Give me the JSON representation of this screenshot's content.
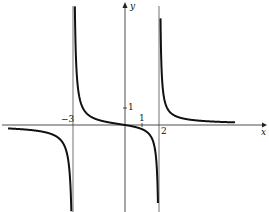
{
  "chart_data": {
    "type": "line",
    "title": "",
    "xlabel": "x",
    "ylabel": "y",
    "function": "y = x / ((x + 3)(x - 2))",
    "vertical_asymptotes": [
      -3,
      2
    ],
    "horizontal_asymptote": 0,
    "x_tick_labels": [
      "-3",
      "1",
      "2"
    ],
    "y_tick_labels": [
      "1"
    ],
    "xlim": [
      -7,
      6
    ],
    "ylim": [
      -5,
      7
    ],
    "grid": false,
    "series": [
      {
        "name": "left branch",
        "x": [
          -7,
          -6,
          -5,
          -4,
          -3.5,
          -3.2,
          -3.1
        ],
        "y": [
          -0.25,
          -0.25,
          -0.357,
          -0.667,
          -1.273,
          -3.098,
          -6.078
        ]
      },
      {
        "name": "middle branch",
        "x": [
          -2.9,
          -2.5,
          -2,
          -1,
          0,
          0.5,
          1,
          1.5,
          1.8,
          1.9
        ],
        "y": [
          7.07,
          1.111,
          0.5,
          0.167,
          0,
          -0.095,
          -0.25,
          -0.667,
          -1.875,
          -3.878
        ]
      },
      {
        "name": "right branch",
        "x": [
          2.1,
          2.3,
          2.5,
          3,
          4,
          5,
          6
        ],
        "y": [
          4.038,
          1.447,
          0.909,
          0.5,
          0.286,
          0.208,
          0.167
        ]
      }
    ]
  },
  "labels": {
    "x_axis": "x",
    "y_axis": "y",
    "tick_neg3": "−3",
    "tick_1x": "1",
    "tick_2": "2",
    "tick_1y": "1"
  }
}
